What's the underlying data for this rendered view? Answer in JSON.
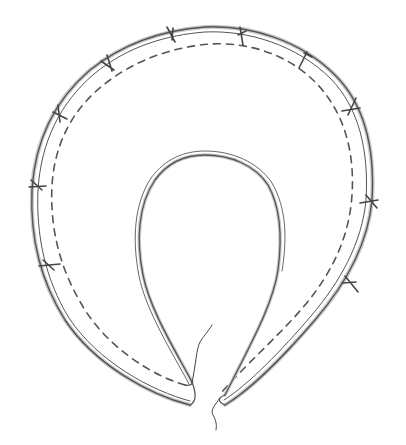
{
  "diagram": {
    "text_labels": [],
    "colors": {
      "background": "#ffffff",
      "outline": "#555555",
      "fill_shading": "#c8c8c8",
      "stitch_line": "#555555",
      "pin": "#444444",
      "thread": "#444444"
    },
    "elements": {
      "outer_edge": "double-line outer edge",
      "inner_edge": "double-line inner opening edge",
      "stitch_line": "dashed seam line",
      "pins_count": 10,
      "thread_ends": 2
    }
  }
}
